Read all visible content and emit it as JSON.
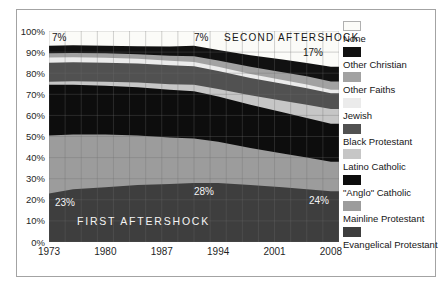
{
  "figure": {
    "annotations": {
      "none_start_pct": "7%",
      "none_mid_pct": "7%",
      "second_aftershock": "SECOND AFTERSHOCK",
      "none_end_pct": "17%",
      "evangelical_start_pct": "23%",
      "first_aftershock": "FIRST AFTERSHOCK",
      "evangelical_peak_pct": "28%",
      "evangelical_end_pct": "24%"
    }
  },
  "chart_data": {
    "type": "area",
    "stacked": true,
    "title": "",
    "xlabel": "",
    "ylabel": "",
    "x_domain": [
      1973,
      2009
    ],
    "y_domain": [
      0,
      100
    ],
    "grid": true,
    "legend_position": "right",
    "x_ticks": [
      "1973",
      "1980",
      "1987",
      "1994",
      "2001",
      "2008"
    ],
    "y_ticks": [
      "100%",
      "90%",
      "80%",
      "70%",
      "60%",
      "50%",
      "40%",
      "30%",
      "20%",
      "10%",
      "0%"
    ],
    "x": [
      1973,
      1976,
      1980,
      1984,
      1988,
      1991,
      1994,
      1998,
      2002,
      2005,
      2008,
      2009
    ],
    "series": [
      {
        "name": "Evangelical Protestant",
        "color": "#3e3e3e",
        "values": [
          23,
          25,
          26,
          27,
          27.5,
          28,
          28,
          27,
          26,
          25,
          24,
          24
        ]
      },
      {
        "name": "Mainline Protestant",
        "color": "#9c9c9c",
        "values": [
          27.5,
          26,
          25,
          23.5,
          22,
          21,
          19.5,
          17.5,
          16,
          15,
          14,
          14
        ]
      },
      {
        "name": "\"Anglo\" Catholic",
        "color": "#0d0d0d",
        "values": [
          24,
          23.5,
          23,
          22.8,
          22.7,
          22.5,
          21.5,
          20.5,
          19.5,
          18.8,
          18,
          18
        ]
      },
      {
        "name": "Latino Catholic",
        "color": "#c6c6c6",
        "values": [
          1.5,
          1.7,
          2,
          2.3,
          2.6,
          3,
          3.5,
          4.5,
          5.5,
          6.3,
          7,
          7
        ]
      },
      {
        "name": "Black Protestant",
        "color": "#515151",
        "values": [
          9,
          9,
          9,
          9,
          9,
          8.8,
          8.5,
          8.2,
          8,
          7.8,
          7.5,
          7.5
        ]
      },
      {
        "name": "Jewish",
        "color": "#ebebeb",
        "values": [
          2.5,
          2.4,
          2.3,
          2.2,
          2.1,
          2,
          2,
          1.9,
          1.8,
          1.7,
          1.6,
          1.6
        ]
      },
      {
        "name": "Other Faiths",
        "color": "#a2a2a2",
        "values": [
          2,
          2,
          2.1,
          2.2,
          2.4,
          2.7,
          3,
          3.4,
          3.7,
          3.9,
          4,
          4
        ]
      },
      {
        "name": "Other Christian",
        "color": "#111111",
        "values": [
          3.5,
          3.6,
          3.6,
          3.8,
          4.4,
          5,
          5,
          5.5,
          6,
          6.3,
          6.9,
          6.9
        ]
      },
      {
        "name": "None",
        "color": "#fbfbf8",
        "swatch_border": "#b0b0b0",
        "values": [
          7,
          6.8,
          7,
          7.2,
          7.3,
          7,
          9,
          11.5,
          13.5,
          15.2,
          17,
          17
        ]
      }
    ]
  }
}
